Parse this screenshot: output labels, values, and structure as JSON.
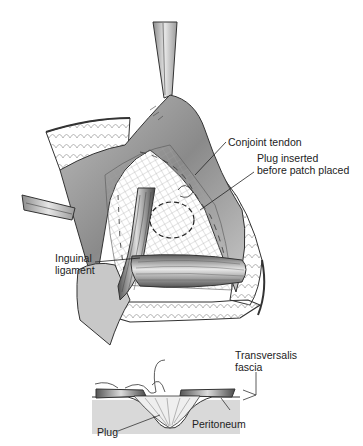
{
  "figure": {
    "upper_view": {
      "labels": {
        "conjoint_tendon": "Conjoint tendon",
        "plug_inserted_line1": "Plug inserted",
        "plug_inserted_line2": "before patch placed",
        "inguinal_line1": "Inguinal",
        "inguinal_line2": "ligament"
      }
    },
    "cross_section": {
      "labels": {
        "transversalis_line1": "Transversalis",
        "transversalis_line2": "fascia",
        "peritoneum": "Peritoneum",
        "plug": "Plug"
      }
    },
    "colors": {
      "background": "#ffffff",
      "line": "#2a2a2a",
      "tissue_dark": "#7a7a7a",
      "tissue_mid": "#a8a8a8",
      "tissue_light": "#d6d6d6",
      "mesh": "#9a9a9a"
    }
  }
}
